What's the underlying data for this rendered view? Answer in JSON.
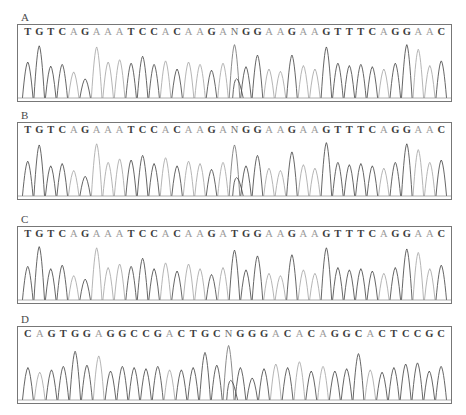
{
  "figure": {
    "type": "sanger-sequencing-chromatograms",
    "panel_count": 4,
    "width": 466,
    "height": 415,
    "background": "#ffffff",
    "trace_colors": {
      "dark": "#4a4a4a",
      "light": "#a8a8a8",
      "mid": "#777777",
      "baseline": "#8c8c8c",
      "frame_border": "#777777"
    }
  },
  "panels": [
    {
      "label": "A",
      "sequence": "TGTCAGAAATCCACAAGANGGAAGAAGTTTCAGGAAC",
      "bases": [
        "T",
        "G",
        "T",
        "C",
        "A",
        "G",
        "A",
        "A",
        "A",
        "T",
        "C",
        "C",
        "A",
        "C",
        "A",
        "A",
        "G",
        "A",
        "N",
        "G",
        "G",
        "A",
        "A",
        "G",
        "A",
        "A",
        "G",
        "T",
        "T",
        "T",
        "C",
        "A",
        "G",
        "G",
        "A",
        "A",
        "C"
      ],
      "ambiguous_positions": [
        19
      ],
      "ambiguous_base": "N",
      "frame": {
        "x": 17,
        "y": 24,
        "width": 435,
        "height": 78
      }
    },
    {
      "label": "B",
      "sequence": "TGTCAGAAATCCACAAGANGGAAGAAGTTTCAGGAAC",
      "bases": [
        "T",
        "G",
        "T",
        "C",
        "A",
        "G",
        "A",
        "A",
        "A",
        "T",
        "C",
        "C",
        "A",
        "C",
        "A",
        "A",
        "G",
        "A",
        "N",
        "G",
        "G",
        "A",
        "A",
        "G",
        "A",
        "A",
        "G",
        "T",
        "T",
        "T",
        "C",
        "A",
        "G",
        "G",
        "A",
        "A",
        "C"
      ],
      "ambiguous_positions": [
        19
      ],
      "ambiguous_base": "N",
      "frame": {
        "x": 17,
        "y": 122,
        "width": 435,
        "height": 78
      }
    },
    {
      "label": "C",
      "sequence": "TGTCAGAAATCCACAAGATGGAAGAAGTTTCAGGAAC",
      "bases": [
        "T",
        "G",
        "T",
        "C",
        "A",
        "G",
        "A",
        "A",
        "A",
        "T",
        "C",
        "C",
        "A",
        "C",
        "A",
        "A",
        "G",
        "A",
        "T",
        "G",
        "G",
        "A",
        "A",
        "G",
        "A",
        "A",
        "G",
        "T",
        "T",
        "T",
        "C",
        "A",
        "G",
        "G",
        "A",
        "A",
        "C"
      ],
      "ambiguous_positions": [],
      "ambiguous_base": "",
      "frame": {
        "x": 17,
        "y": 226,
        "width": 435,
        "height": 78
      }
    },
    {
      "label": "D",
      "sequence": "CAGTGGAGGCCGACTGCNGGGACACAGGCACTCCGC",
      "bases": [
        "C",
        "A",
        "G",
        "T",
        "G",
        "G",
        "A",
        "G",
        "G",
        "C",
        "C",
        "G",
        "A",
        "C",
        "T",
        "G",
        "C",
        "N",
        "G",
        "G",
        "G",
        "A",
        "C",
        "A",
        "C",
        "A",
        "G",
        "G",
        "C",
        "A",
        "C",
        "T",
        "C",
        "C",
        "G",
        "C"
      ],
      "ambiguous_positions": [
        18
      ],
      "ambiguous_base": "N",
      "frame": {
        "x": 17,
        "y": 326,
        "width": 435,
        "height": 78
      }
    }
  ],
  "chart_data": {
    "type": "line",
    "title": "",
    "xlabel": "",
    "ylabel": "",
    "grid": false,
    "legend": "none",
    "series": [
      {
        "name": "A",
        "categories": [
          "T",
          "G",
          "T",
          "C",
          "A",
          "G",
          "A",
          "A",
          "A",
          "T",
          "C",
          "C",
          "A",
          "C",
          "A",
          "A",
          "G",
          "A",
          "N",
          "G",
          "G",
          "A",
          "A",
          "G",
          "A",
          "A",
          "G",
          "T",
          "T",
          "T",
          "C",
          "A",
          "G",
          "G",
          "A",
          "A",
          "C"
        ],
        "values": [
          62,
          90,
          55,
          58,
          45,
          33,
          88,
          62,
          66,
          60,
          72,
          58,
          64,
          50,
          62,
          58,
          48,
          60,
          92,
          54,
          74,
          50,
          46,
          74,
          56,
          50,
          88,
          60,
          56,
          58,
          54,
          50,
          60,
          92,
          84,
          56,
          64
        ],
        "tone": [
          "dark",
          "dark",
          "dark",
          "dark",
          "light",
          "dark",
          "light",
          "light",
          "light",
          "dark",
          "dark",
          "dark",
          "light",
          "dark",
          "light",
          "light",
          "dark",
          "light",
          "mid",
          "dark",
          "dark",
          "light",
          "light",
          "dark",
          "light",
          "light",
          "dark",
          "dark",
          "dark",
          "dark",
          "dark",
          "light",
          "dark",
          "dark",
          "light",
          "light",
          "dark"
        ]
      },
      {
        "name": "B",
        "categories": [
          "T",
          "G",
          "T",
          "C",
          "A",
          "G",
          "A",
          "A",
          "A",
          "T",
          "C",
          "C",
          "A",
          "C",
          "A",
          "A",
          "G",
          "A",
          "N",
          "G",
          "G",
          "A",
          "A",
          "G",
          "A",
          "A",
          "G",
          "T",
          "T",
          "T",
          "C",
          "A",
          "G",
          "G",
          "A",
          "A",
          "C"
        ],
        "values": [
          60,
          88,
          52,
          56,
          44,
          34,
          90,
          58,
          64,
          62,
          70,
          56,
          66,
          52,
          60,
          56,
          46,
          58,
          88,
          52,
          70,
          48,
          44,
          76,
          54,
          48,
          92,
          58,
          54,
          56,
          52,
          48,
          58,
          90,
          80,
          58,
          62
        ],
        "tone": [
          "dark",
          "dark",
          "dark",
          "dark",
          "light",
          "dark",
          "light",
          "light",
          "light",
          "dark",
          "dark",
          "dark",
          "light",
          "dark",
          "light",
          "light",
          "dark",
          "light",
          "mid",
          "dark",
          "dark",
          "light",
          "light",
          "dark",
          "light",
          "light",
          "dark",
          "dark",
          "dark",
          "dark",
          "dark",
          "light",
          "dark",
          "dark",
          "light",
          "light",
          "dark"
        ]
      },
      {
        "name": "C",
        "categories": [
          "T",
          "G",
          "T",
          "C",
          "A",
          "G",
          "A",
          "A",
          "A",
          "T",
          "C",
          "C",
          "A",
          "C",
          "A",
          "A",
          "G",
          "A",
          "T",
          "G",
          "G",
          "A",
          "A",
          "G",
          "A",
          "A",
          "G",
          "T",
          "T",
          "T",
          "C",
          "A",
          "G",
          "G",
          "A",
          "A",
          "C"
        ],
        "values": [
          58,
          92,
          54,
          60,
          42,
          36,
          90,
          56,
          62,
          58,
          72,
          54,
          64,
          50,
          62,
          54,
          44,
          56,
          86,
          52,
          76,
          46,
          42,
          78,
          52,
          46,
          90,
          56,
          52,
          54,
          50,
          46,
          56,
          88,
          82,
          54,
          60
        ],
        "tone": [
          "dark",
          "dark",
          "dark",
          "dark",
          "light",
          "dark",
          "light",
          "light",
          "light",
          "dark",
          "dark",
          "dark",
          "light",
          "dark",
          "light",
          "light",
          "dark",
          "light",
          "dark",
          "dark",
          "dark",
          "light",
          "light",
          "dark",
          "light",
          "light",
          "dark",
          "dark",
          "dark",
          "dark",
          "dark",
          "light",
          "dark",
          "dark",
          "light",
          "light",
          "dark"
        ]
      },
      {
        "name": "D",
        "categories": [
          "C",
          "A",
          "G",
          "T",
          "G",
          "G",
          "A",
          "G",
          "G",
          "C",
          "C",
          "G",
          "A",
          "C",
          "T",
          "G",
          "C",
          "N",
          "G",
          "G",
          "G",
          "A",
          "C",
          "A",
          "C",
          "A",
          "G",
          "G",
          "C",
          "A",
          "C",
          "T",
          "C",
          "C",
          "G",
          "C"
        ],
        "values": [
          56,
          48,
          52,
          58,
          84,
          60,
          76,
          50,
          58,
          56,
          54,
          58,
          52,
          52,
          56,
          82,
          60,
          94,
          56,
          38,
          54,
          62,
          56,
          66,
          50,
          58,
          50,
          54,
          80,
          52,
          48,
          56,
          62,
          64,
          50,
          58
        ],
        "tone": [
          "dark",
          "light",
          "dark",
          "dark",
          "dark",
          "dark",
          "light",
          "dark",
          "dark",
          "dark",
          "dark",
          "dark",
          "light",
          "dark",
          "dark",
          "dark",
          "dark",
          "mid",
          "dark",
          "dark",
          "dark",
          "light",
          "dark",
          "light",
          "dark",
          "light",
          "dark",
          "dark",
          "dark",
          "light",
          "dark",
          "dark",
          "dark",
          "dark",
          "dark",
          "dark"
        ]
      }
    ]
  }
}
